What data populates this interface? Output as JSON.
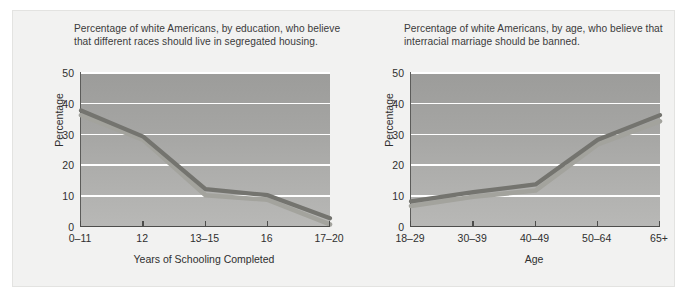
{
  "figure": {
    "background_color": "#f2f2f1",
    "plot_fill_top": "#9c9c9a",
    "plot_fill_bottom": "#b8b8b6",
    "gridline_color": "#ffffff",
    "axis_color": "#4d4d4b"
  },
  "chart_data": [
    {
      "type": "line",
      "id": "education-segregated-housing",
      "title": "Percentage of white Americans, by education, who believe that different races should live in segregated housing.",
      "xlabel": "Years of Schooling Completed",
      "ylabel": "Percentage",
      "categories": [
        "0–11",
        "12",
        "13–15",
        "16",
        "17–20"
      ],
      "yticks": [
        0,
        10,
        20,
        30,
        40,
        50
      ],
      "ylim": [
        0,
        50
      ],
      "grid": true,
      "legend": "none",
      "series": [
        {
          "name": "upper-line",
          "color": "#74746f",
          "values": [
            37.5,
            29.0,
            12.0,
            10.0,
            2.5
          ]
        },
        {
          "name": "lower-line",
          "color": "#a3a39d",
          "values": [
            36.0,
            28.0,
            10.0,
            8.5,
            0.5
          ]
        }
      ]
    },
    {
      "type": "line",
      "id": "age-interracial-marriage",
      "title": "Percentage of white Americans, by age, who believe that interracial marriage should be banned.",
      "xlabel": "Age",
      "ylabel": "Percentage",
      "categories": [
        "18–29",
        "30–39",
        "40–49",
        "50–64",
        "65+"
      ],
      "yticks": [
        0,
        10,
        20,
        30,
        40,
        50
      ],
      "ylim": [
        0,
        50
      ],
      "grid": true,
      "legend": "none",
      "series": [
        {
          "name": "upper-line",
          "color": "#74746f",
          "values": [
            8.0,
            11.0,
            13.5,
            28.0,
            36.0
          ]
        },
        {
          "name": "lower-line",
          "color": "#a3a39d",
          "values": [
            6.5,
            9.5,
            11.5,
            26.5,
            34.0
          ]
        }
      ]
    }
  ],
  "left_chart": {
    "caption": "Percentage of white Americans, by education, who believe that different races should live in segregated housing.",
    "xlabel": "Years of Schooling Completed",
    "ylabel": "Percentage"
  },
  "right_chart": {
    "caption": "Percentage of white Americans, by age, who believe that interracial marriage should be banned.",
    "xlabel": "Age",
    "ylabel": "Percentage"
  }
}
